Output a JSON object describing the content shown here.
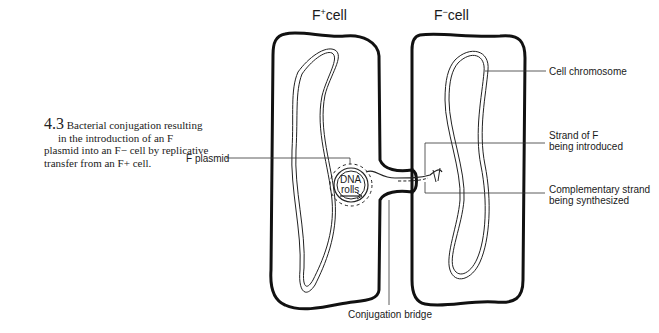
{
  "figure": {
    "number": "4.3",
    "caption_lines": [
      "Bacterial conjugation resulting",
      "in the introduction of an F",
      "plasmid into an F− cell by replicative",
      "transfer from an F+ cell."
    ]
  },
  "cells": {
    "left_title": "F",
    "left_sup": "+",
    "left_suffix": "cell",
    "right_title": "F",
    "right_sup": "−",
    "right_suffix": "cell"
  },
  "labels": {
    "f_plasmid": "F plasmid",
    "dna_rolls_1": "DNA",
    "dna_rolls_2": "rolls",
    "cell_chromosome": "Cell chromosome",
    "strand_introduced_1": "Strand of F",
    "strand_introduced_2": "being introduced",
    "complementary_1": "Complementary strand",
    "complementary_2": "being synthesized",
    "conjugation_bridge": "Conjugation bridge"
  }
}
